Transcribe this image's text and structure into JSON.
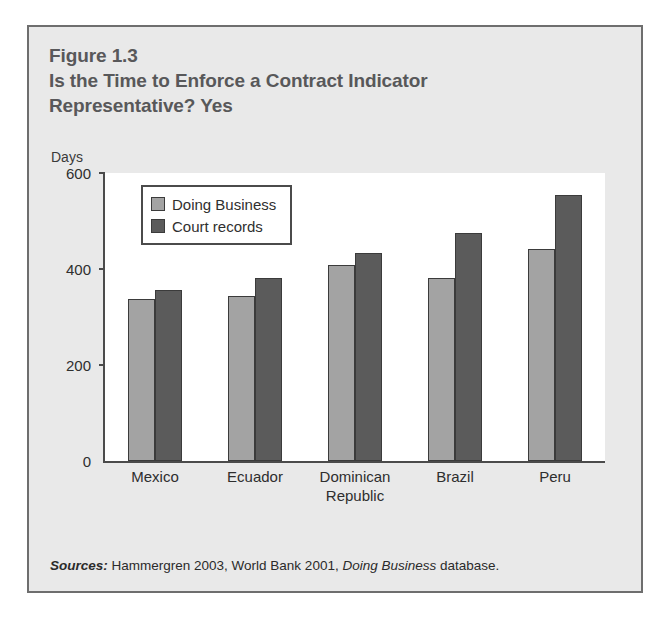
{
  "figure": {
    "label": "Figure 1.3",
    "title_line_1": "Is the Time to Enforce a Contract Indicator",
    "title_line_2": "Representative? Yes",
    "source_prefix": "Sources:",
    "source_text_1": " Hammergren 2003, World Bank 2001, ",
    "source_italic": "Doing Business",
    "source_text_2": " database."
  },
  "colors": {
    "panel_background": "#e9e9e9",
    "panel_border": "#6e6e6e",
    "plot_background": "#ffffff",
    "axis": "#4b4b4b",
    "title_text": "#58585a",
    "series_doing_business": "#a3a3a3",
    "series_court_records": "#5b5b5b"
  },
  "chart_data": {
    "type": "bar",
    "title": "Is the Time to Enforce a Contract Indicator Representative? Yes",
    "subtitle": "Figure 1.3",
    "xlabel": "",
    "ylabel": "Days",
    "ylim": [
      0,
      600
    ],
    "yticks": [
      0,
      200,
      400,
      600
    ],
    "ytick_labels": [
      "0",
      "200",
      "400",
      "600"
    ],
    "grid": false,
    "legend_position": "top-left-inside",
    "categories": [
      "Mexico",
      "Ecuador",
      "Dominican Republic",
      "Brazil",
      "Peru"
    ],
    "category_label_lines": [
      [
        "Mexico"
      ],
      [
        "Ecuador"
      ],
      [
        "Dominican",
        "Republic"
      ],
      [
        "Brazil"
      ],
      [
        "Peru"
      ]
    ],
    "series": [
      {
        "name": "Doing Business",
        "color": "#a3a3a3",
        "values": [
          338,
          344,
          408,
          381,
          442
        ]
      },
      {
        "name": "Court records",
        "color": "#5b5b5b",
        "values": [
          356,
          381,
          433,
          475,
          554
        ]
      }
    ],
    "annotations": [],
    "source": "Sources: Hammergren 2003, World Bank 2001, Doing Business database."
  }
}
